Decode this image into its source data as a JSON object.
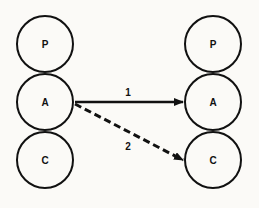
{
  "diagram": {
    "left_column": [
      {
        "id": "P",
        "label": "P",
        "cx": 45,
        "cy": 44
      },
      {
        "id": "A",
        "label": "A",
        "cx": 45,
        "cy": 102
      },
      {
        "id": "C",
        "label": "C",
        "cx": 45,
        "cy": 160
      }
    ],
    "right_column": [
      {
        "id": "P",
        "label": "P",
        "cx": 213,
        "cy": 44
      },
      {
        "id": "A",
        "label": "A",
        "cx": 213,
        "cy": 102
      },
      {
        "id": "C",
        "label": "C",
        "cx": 213,
        "cy": 160
      }
    ],
    "radius": 28,
    "arrows": [
      {
        "label": "1",
        "from": "left.A",
        "to": "right.A",
        "style": "solid"
      },
      {
        "label": "2",
        "from": "left.A",
        "to": "right.C",
        "style": "dashed"
      }
    ],
    "colors": {
      "stroke": "#111111",
      "background": "#fbfaf7"
    }
  }
}
